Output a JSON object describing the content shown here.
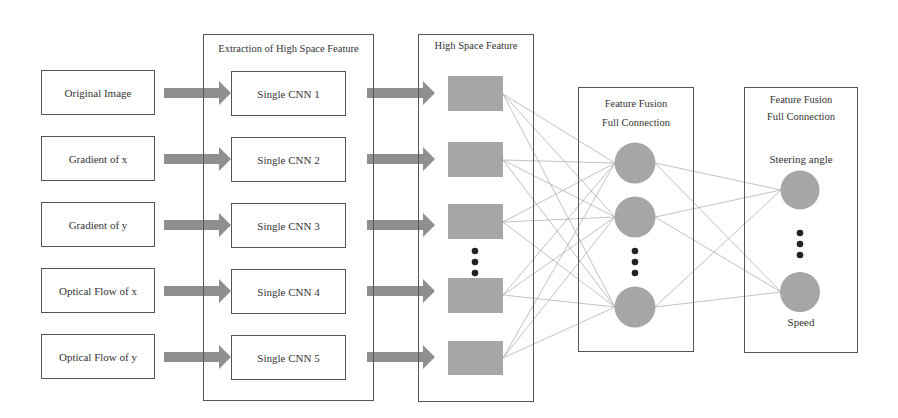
{
  "diagram": {
    "inputs": [
      "Original Image",
      "Gradient of x",
      "Gradient of y",
      "Optical Flow of x",
      "Optical Flow of y"
    ],
    "extraction": {
      "title": "Extraction of High Space Feature",
      "cnns": [
        "Single CNN 1",
        "Single CNN 2",
        "Single CNN 3",
        "Single CNN 4",
        "Single CNN 5"
      ]
    },
    "high_space": {
      "title": "High Space Feature"
    },
    "fusion1": {
      "title_line1": "Feature Fusion",
      "title_line2": "Full Connection"
    },
    "fusion2": {
      "title_line1": "Feature Fusion",
      "title_line2": "Full Connection",
      "output_top": "Steering angle",
      "output_bottom": "Speed"
    },
    "colors": {
      "shape_fill": "#a6a6a6",
      "arrow_fill": "#8f8f8f",
      "line": "#9a9a9a",
      "border": "#555555"
    }
  }
}
